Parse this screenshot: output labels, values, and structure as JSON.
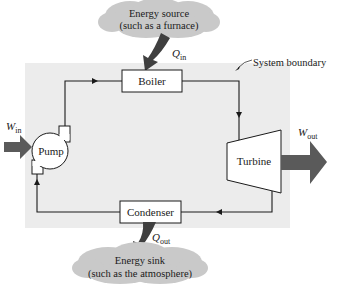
{
  "diagram": {
    "type": "heat-engine-cycle",
    "colors": {
      "boundary_fill": "#ececec",
      "cloud_fill": "#c9c9c9",
      "heat_arrow": "#3f3f3f",
      "work_arrow": "#5a5a5a",
      "line": "#1a1a1a",
      "box_fill": "#ffffff"
    },
    "energy_source": {
      "line1": "Energy source",
      "line2": "(such as a furnace)"
    },
    "energy_sink": {
      "line1": "Energy sink",
      "line2": "(such as the atmosphere)"
    },
    "system_boundary_label": "System boundary",
    "components": {
      "boiler": "Boiler",
      "turbine": "Turbine",
      "condenser": "Condenser",
      "pump": "Pump"
    },
    "flows": {
      "q_in": {
        "symbol": "Q",
        "subscript": "in"
      },
      "q_out": {
        "symbol": "Q",
        "subscript": "out"
      },
      "w_in": {
        "symbol": "W",
        "subscript": "in"
      },
      "w_out": {
        "symbol": "W",
        "subscript": "out"
      }
    }
  }
}
